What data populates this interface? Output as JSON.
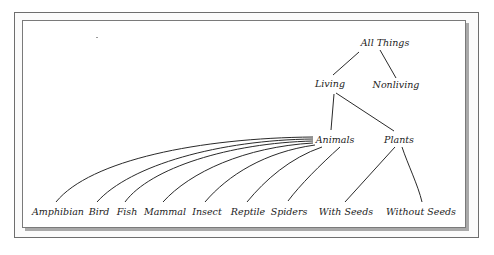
{
  "diagram": {
    "type": "tree",
    "root": "All Things",
    "nodes": {
      "all_things": "All Things",
      "living": "Living",
      "nonliving": "Nonliving",
      "animals": "Animals",
      "plants": "Plants",
      "amphibian": "Amphibian",
      "bird": "Bird",
      "fish": "Fish",
      "mammal": "Mammal",
      "insect": "Insect",
      "reptile": "Reptile",
      "spiders": "Spiders",
      "with_seeds": "With Seeds",
      "without_seeds": "Without Seeds"
    },
    "edges": [
      [
        "All Things",
        "Living"
      ],
      [
        "All Things",
        "Nonliving"
      ],
      [
        "Living",
        "Animals"
      ],
      [
        "Living",
        "Plants"
      ],
      [
        "Animals",
        "Amphibian"
      ],
      [
        "Animals",
        "Bird"
      ],
      [
        "Animals",
        "Fish"
      ],
      [
        "Animals",
        "Mammal"
      ],
      [
        "Animals",
        "Insect"
      ],
      [
        "Animals",
        "Reptile"
      ],
      [
        "Animals",
        "Spiders"
      ],
      [
        "Plants",
        "With Seeds"
      ],
      [
        "Plants",
        "Without Seeds"
      ]
    ]
  },
  "colors": {
    "line": "#2a2a2a",
    "text": "#222222",
    "border": "#6e6e6e",
    "shadow": "#a9a9a9"
  }
}
